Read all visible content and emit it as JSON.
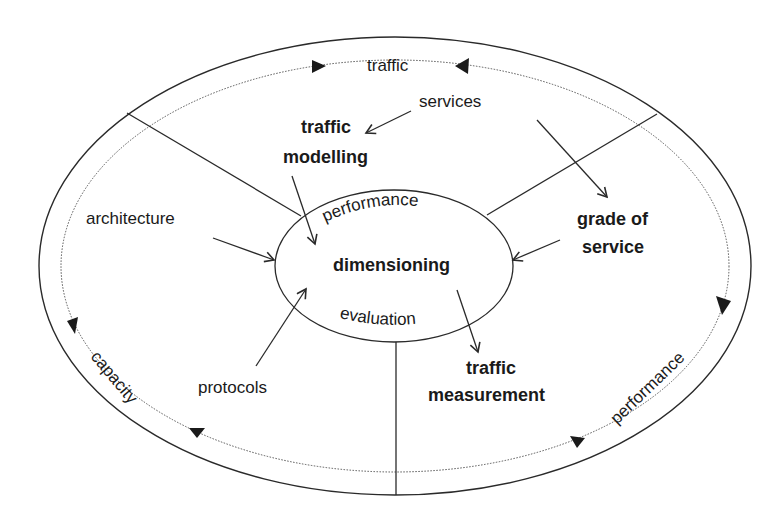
{
  "diagram": {
    "colors": {
      "line": "#2a2a2a",
      "background": "#ffffff",
      "text": "#1a1a1a"
    },
    "outer_ring": {
      "labels": {
        "top": "traffic",
        "left": "capacity",
        "right": "performance"
      }
    },
    "inner_ellipse": {
      "top": "performance",
      "center": "dimensioning",
      "bottom": "evaluation"
    },
    "nodes": {
      "services": "services",
      "traffic_modelling_line1": "traffic",
      "traffic_modelling_line2": "modelling",
      "architecture": "architecture",
      "grade_of_service_line1": "grade of",
      "grade_of_service_line2": "service",
      "protocols": "protocols",
      "traffic_measurement_line1": "traffic",
      "traffic_measurement_line2": "measurement"
    }
  }
}
